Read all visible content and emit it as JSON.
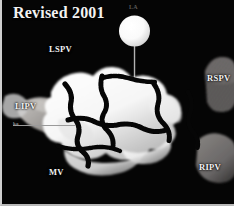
{
  "figure": {
    "title": "Revised 2001",
    "background_color": "#050505",
    "border_color": "#cfcfcf"
  },
  "labels": {
    "lspv": "LSPV",
    "rspv": "RSPV",
    "lipv": "LIPV",
    "ripv": "RIPV",
    "mv": "MV",
    "la": "LA",
    "leader_tick": "ka"
  },
  "colors": {
    "tissue": "#fbfbfb",
    "tissue_shadow": "#8f8f8f",
    "vein_gray": "#9d9a97",
    "lesion_line": "#050505",
    "label_text": "#f2f2f2",
    "leader_line": "#9a9a9a"
  },
  "annotations": {
    "balloon_catheter": "balloon-catheter",
    "ablation_lines": "ablation-lesion-lines"
  }
}
